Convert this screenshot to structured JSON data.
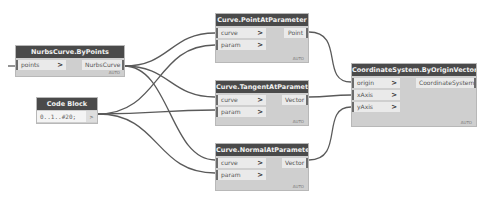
{
  "nodes": {
    "nurbs": {
      "title": "NurbsCurve.ByPoints",
      "inputs": [
        {
          "label": "points",
          "chevron": ">"
        }
      ],
      "output": "NurbsCurve",
      "lacing": "AUTO"
    },
    "codeblock": {
      "title": "Code Block",
      "code": "0..1..#20;",
      "output_chevron": ">"
    },
    "point": {
      "title": "Curve.PointAtParameter",
      "inputs": [
        {
          "label": "curve",
          "chevron": ">"
        },
        {
          "label": "param",
          "chevron": ">"
        }
      ],
      "output": "Point",
      "lacing": "AUTO"
    },
    "tangent": {
      "title": "Curve.TangentAtParameter",
      "inputs": [
        {
          "label": "curve",
          "chevron": ">"
        },
        {
          "label": "param",
          "chevron": ">"
        }
      ],
      "output": "Vector",
      "lacing": "AUTO"
    },
    "normal": {
      "title": "Curve.NormalAtParameter",
      "inputs": [
        {
          "label": "curve",
          "chevron": ">"
        },
        {
          "label": "param",
          "chevron": ">"
        }
      ],
      "output": "Vector",
      "lacing": "AUTO"
    },
    "coord": {
      "title": "CoordinateSystem.ByOriginVectors",
      "inputs": [
        {
          "label": "origin",
          "chevron": ">"
        },
        {
          "label": "xAxis",
          "chevron": ">"
        },
        {
          "label": "yAxis",
          "chevron": ">"
        }
      ],
      "output": "CoordinateSystem",
      "lacing": "AUTO"
    }
  },
  "colors": {
    "header": "#4a4a4a",
    "body": "#cfcfcf",
    "port": "#eaeaea",
    "wire": "#555555"
  }
}
